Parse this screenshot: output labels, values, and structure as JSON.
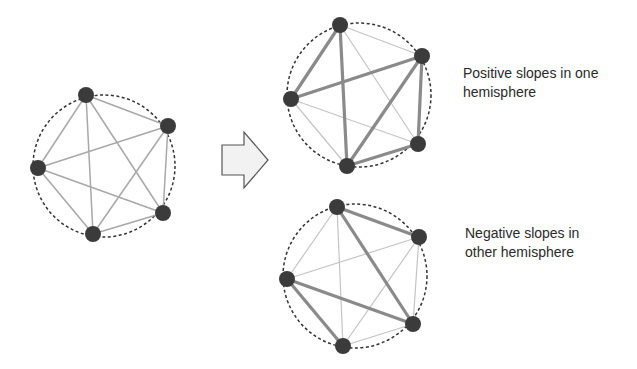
{
  "colors": {
    "node": "#3b3b3b",
    "thick_edge": "#8a8a8a",
    "thin_edge": "#c4c4c4",
    "circle": "#333333",
    "arrow_fill": "#f2f2f2",
    "arrow_stroke": "#555555"
  },
  "graphs": [
    {
      "id": "original",
      "nodes": [
        "n1",
        "n2",
        "n3",
        "n4",
        "n5"
      ],
      "edges": [
        {
          "from": "n1",
          "to": "n2",
          "weight": "thin"
        },
        {
          "from": "n1",
          "to": "n3",
          "weight": "thin"
        },
        {
          "from": "n1",
          "to": "n4",
          "weight": "thin"
        },
        {
          "from": "n1",
          "to": "n5",
          "weight": "thin"
        },
        {
          "from": "n2",
          "to": "n3",
          "weight": "thin"
        },
        {
          "from": "n2",
          "to": "n4",
          "weight": "thin"
        },
        {
          "from": "n2",
          "to": "n5",
          "weight": "thin"
        },
        {
          "from": "n3",
          "to": "n4",
          "weight": "thin"
        },
        {
          "from": "n3",
          "to": "n5",
          "weight": "thin"
        },
        {
          "from": "n4",
          "to": "n5",
          "weight": "thin"
        }
      ]
    },
    {
      "id": "positive",
      "nodes": [
        "n1",
        "n2",
        "n3",
        "n4",
        "n5"
      ],
      "edges": [
        {
          "from": "n1",
          "to": "n2",
          "weight": "thin"
        },
        {
          "from": "n1",
          "to": "n3",
          "weight": "thick"
        },
        {
          "from": "n1",
          "to": "n4",
          "weight": "thin"
        },
        {
          "from": "n1",
          "to": "n5",
          "weight": "thick"
        },
        {
          "from": "n2",
          "to": "n3",
          "weight": "thick"
        },
        {
          "from": "n2",
          "to": "n4",
          "weight": "thick"
        },
        {
          "from": "n2",
          "to": "n5",
          "weight": "thick"
        },
        {
          "from": "n3",
          "to": "n4",
          "weight": "thin"
        },
        {
          "from": "n3",
          "to": "n5",
          "weight": "thin"
        },
        {
          "from": "n4",
          "to": "n5",
          "weight": "thick"
        }
      ]
    },
    {
      "id": "negative",
      "nodes": [
        "n1",
        "n2",
        "n3",
        "n4",
        "n5"
      ],
      "edges": [
        {
          "from": "n1",
          "to": "n2",
          "weight": "thick"
        },
        {
          "from": "n1",
          "to": "n3",
          "weight": "thin"
        },
        {
          "from": "n1",
          "to": "n4",
          "weight": "thick"
        },
        {
          "from": "n1",
          "to": "n5",
          "weight": "thin"
        },
        {
          "from": "n2",
          "to": "n3",
          "weight": "thin"
        },
        {
          "from": "n2",
          "to": "n4",
          "weight": "thin"
        },
        {
          "from": "n2",
          "to": "n5",
          "weight": "thin"
        },
        {
          "from": "n3",
          "to": "n4",
          "weight": "thick"
        },
        {
          "from": "n3",
          "to": "n5",
          "weight": "thick"
        },
        {
          "from": "n4",
          "to": "n5",
          "weight": "thin"
        }
      ]
    }
  ],
  "labels": {
    "positive": [
      "Positive slopes in one",
      "hemisphere"
    ],
    "negative": [
      "Negative slopes in",
      "other hemisphere"
    ]
  },
  "arrow": {
    "icon": "right-arrow-icon"
  }
}
